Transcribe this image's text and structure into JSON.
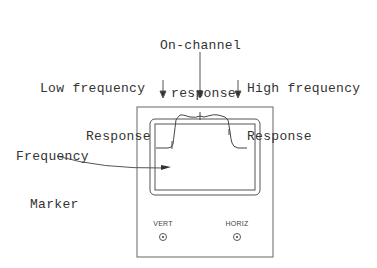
{
  "labels": {
    "on_channel": [
      "On-channel",
      "response"
    ],
    "low_freq": [
      "Low frequency",
      "Response"
    ],
    "high_freq": [
      "High frequency",
      "Response"
    ],
    "marker": [
      "Frequency",
      "Marker"
    ]
  },
  "controls": {
    "vert": "VERT",
    "horiz": "HORIZ"
  },
  "colors": {
    "line": "#555555",
    "text": "#333333"
  }
}
